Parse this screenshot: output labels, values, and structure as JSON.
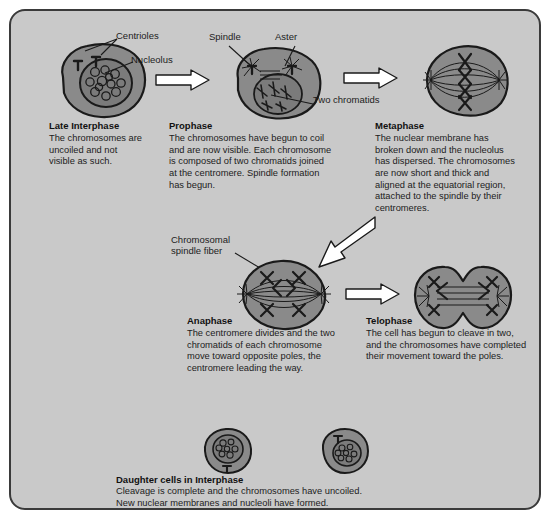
{
  "figure": {
    "panel_bg": "#c9c9c9",
    "panel_border": "#3a3a3a",
    "cell_fill": "#8a8a8a",
    "nucleus_fill": "#7b7b7b",
    "ink": "#111111",
    "arrow_fill": "#ffffff"
  },
  "callouts": {
    "centrioles": "Centrioles",
    "nucleolus": "Nucleolus",
    "spindle": "Spindle",
    "aster": "Aster",
    "two_chromatids": "Two chromatids",
    "chromosomal_spindle_fiber_line1": "Chromosomal",
    "chromosomal_spindle_fiber_line2": "spindle fiber"
  },
  "stages": [
    {
      "id": "late-interphase",
      "title": "Late Interphase",
      "body": "The chromosomes are\nuncoiled and not\nvisible as such."
    },
    {
      "id": "prophase",
      "title": "Prophase",
      "body": "The chromosomes have begun to coil\nand are now visible. Each chromosome\nis composed of two chromatids joined\nat the centromere. Spindle formation\nhas begun."
    },
    {
      "id": "metaphase",
      "title": "Metaphase",
      "body": "The nuclear membrane has\nbroken down and the nucleolus\nhas dispersed. The chromosomes\nare now short and thick and\naligned at the equatorial region,\nattached to the spindle by their\ncentromeres."
    },
    {
      "id": "anaphase",
      "title": "Anaphase",
      "body": "The centromere divides and the two\nchromatids of each chromosome\nmove toward opposite poles, the\ncentromere leading the way."
    },
    {
      "id": "telophase",
      "title": "Telophase",
      "body": "The cell has begun to cleave in two,\nand the chromosomes have completed\ntheir movement toward the poles."
    }
  ],
  "daughter": {
    "title": "Daughter cells in Interphase",
    "body": "Cleavage is complete and the chromosomes have uncoiled.\nNew nuclear membranes and nucleoli have formed."
  }
}
